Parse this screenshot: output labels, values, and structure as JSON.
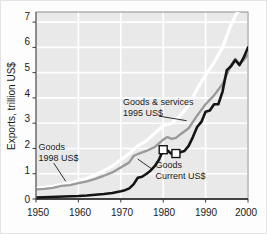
{
  "chart_data": {
    "type": "line",
    "title": "",
    "subtitle": "",
    "xlabel": "",
    "ylabel": "Exports, trillion US$",
    "xlim": [
      1950,
      2000
    ],
    "ylim": [
      0,
      7.4
    ],
    "xticks": [
      1950,
      1960,
      1970,
      1980,
      1990,
      2000
    ],
    "yticks": [
      0,
      1,
      2,
      3,
      4,
      5,
      6,
      7
    ],
    "grid": true,
    "grid_color": "#ffffff",
    "plot_background": "#e9e9e9",
    "legend_position": "inline-annotations",
    "series": [
      {
        "name": "Goods & services 1995 US$",
        "color": "#ffffff",
        "stroke_width": 3.2,
        "x": [
          1950,
          1952,
          1954,
          1956,
          1958,
          1960,
          1962,
          1964,
          1966,
          1968,
          1970,
          1972,
          1974,
          1976,
          1978,
          1980,
          1982,
          1984,
          1986,
          1988,
          1990,
          1992,
          1994,
          1996,
          1997,
          1998
        ],
        "values": [
          0.42,
          0.46,
          0.5,
          0.58,
          0.62,
          0.72,
          0.82,
          0.96,
          1.12,
          1.3,
          1.55,
          1.8,
          2.1,
          2.3,
          2.6,
          2.9,
          3.0,
          3.3,
          3.7,
          4.35,
          4.9,
          5.4,
          6.0,
          6.9,
          7.25,
          7.5
        ]
      },
      {
        "name": "Goods 1998 US$",
        "color": "#9a9a9a",
        "stroke_width": 2.4,
        "x": [
          1950,
          1952,
          1954,
          1956,
          1958,
          1960,
          1962,
          1964,
          1966,
          1968,
          1970,
          1972,
          1973,
          1974,
          1976,
          1978,
          1980,
          1981,
          1982,
          1983,
          1984,
          1986,
          1988,
          1990,
          1992,
          1994,
          1996,
          1997,
          1998,
          1999,
          2000
        ],
        "values": [
          0.38,
          0.4,
          0.44,
          0.52,
          0.55,
          0.63,
          0.7,
          0.8,
          0.92,
          1.05,
          1.25,
          1.45,
          1.7,
          1.78,
          1.9,
          2.05,
          2.35,
          2.45,
          2.38,
          2.42,
          2.55,
          2.8,
          3.3,
          3.75,
          4.1,
          4.55,
          5.3,
          5.55,
          5.35,
          5.5,
          5.72
        ]
      },
      {
        "name": "Goods Current US$",
        "color": "#141414",
        "stroke_width": 2.6,
        "x": [
          1950,
          1955,
          1960,
          1962,
          1964,
          1966,
          1968,
          1970,
          1971,
          1972,
          1973,
          1974,
          1975,
          1976,
          1977,
          1978,
          1979,
          1980,
          1981,
          1982,
          1983,
          1984,
          1985,
          1986,
          1987,
          1988,
          1989,
          1990,
          1991,
          1992,
          1993,
          1994,
          1995,
          1996,
          1997,
          1998,
          1999,
          2000
        ],
        "values": [
          0.06,
          0.09,
          0.12,
          0.14,
          0.17,
          0.2,
          0.24,
          0.31,
          0.35,
          0.42,
          0.58,
          0.84,
          0.88,
          0.99,
          1.12,
          1.3,
          1.55,
          1.95,
          1.92,
          1.78,
          1.8,
          1.85,
          1.9,
          2.1,
          2.45,
          2.85,
          3.05,
          3.45,
          3.5,
          3.75,
          3.75,
          4.25,
          5.1,
          5.25,
          5.5,
          5.3,
          5.6,
          6.0
        ]
      }
    ],
    "markers": [
      {
        "x": 1980,
        "y": 1.95,
        "shape": "square",
        "fill": "#ffffff",
        "stroke": "#141414"
      },
      {
        "x": 1983,
        "y": 1.8,
        "shape": "square",
        "fill": "#ffffff",
        "stroke": "#141414"
      }
    ],
    "annotations": [
      {
        "id": "goods-services-annotation",
        "line1": "Goods & services",
        "line2": "1995 US$",
        "x": 1970.5,
        "y": 3.72,
        "leader_from": [
          1979.0,
          3.28
        ],
        "leader_to": [
          1985.5,
          3.1
        ]
      },
      {
        "id": "goods-1998-annotation",
        "line1": "Goods",
        "line2": "1998 US$",
        "x": 1950.6,
        "y": 1.94,
        "leader_from": [
          1954.2,
          1.42
        ],
        "leader_to": [
          1957.0,
          0.7
        ]
      },
      {
        "id": "goods-current-annotation",
        "line1": "Goods",
        "line2": "Current US$",
        "x": 1978.2,
        "y": 1.22,
        "leader_from": [
          1977.4,
          1.18
        ],
        "leader_to": [
          1974.0,
          1.58
        ]
      }
    ]
  },
  "axis": {
    "y_title": "Exports, trillion US$",
    "y_tick_labels": [
      "0",
      "1",
      "2",
      "3",
      "4",
      "5",
      "6",
      "7"
    ],
    "x_tick_labels": [
      "1950",
      "1960",
      "1970",
      "1980",
      "1990",
      "2000"
    ]
  }
}
